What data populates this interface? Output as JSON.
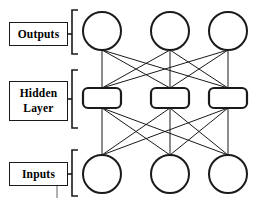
{
  "diagram": {
    "background_color": "#ffffff",
    "stroke_color": "#1a1a1a",
    "node_fill": "#ffffff",
    "layers": [
      {
        "id": "outputs",
        "label_lines": [
          "Outputs"
        ],
        "node_shape": "circle",
        "node_count": 3,
        "cy": 31,
        "radius": 19,
        "label_box": {
          "x": 9,
          "y": 22,
          "w": 59,
          "h": 24
        },
        "bracket": {
          "x": 72,
          "y": 10,
          "h": 44
        },
        "stub": {
          "y": 34
        }
      },
      {
        "id": "hidden",
        "label_lines": [
          "Hidden",
          "Layer"
        ],
        "node_shape": "rounded-rect",
        "node_count": 3,
        "cy": 98,
        "box_w": 38,
        "box_h": 20,
        "corner_radius": 5,
        "label_box": {
          "x": 9,
          "y": 81,
          "w": 59,
          "h": 40
        },
        "bracket": {
          "x": 72,
          "y": 70,
          "h": 58
        },
        "stub": {
          "y": 99
        }
      },
      {
        "id": "inputs",
        "label_lines": [
          "Inputs"
        ],
        "node_shape": "circle",
        "node_count": 3,
        "cy": 174,
        "radius": 19,
        "label_box": {
          "x": 9,
          "y": 162,
          "w": 59,
          "h": 24
        },
        "bracket": {
          "x": 72,
          "y": 150,
          "h": 46
        },
        "stub": {
          "y": 174
        },
        "tick": {
          "x": 57,
          "y1": 186,
          "y2": 198
        }
      }
    ],
    "columns_x": [
      102,
      170,
      228
    ],
    "connections": [
      {
        "from": "outputs",
        "to": "hidden",
        "pattern": "full",
        "count": 9
      },
      {
        "from": "hidden",
        "to": "inputs",
        "pattern": "full",
        "count": 9
      }
    ]
  }
}
